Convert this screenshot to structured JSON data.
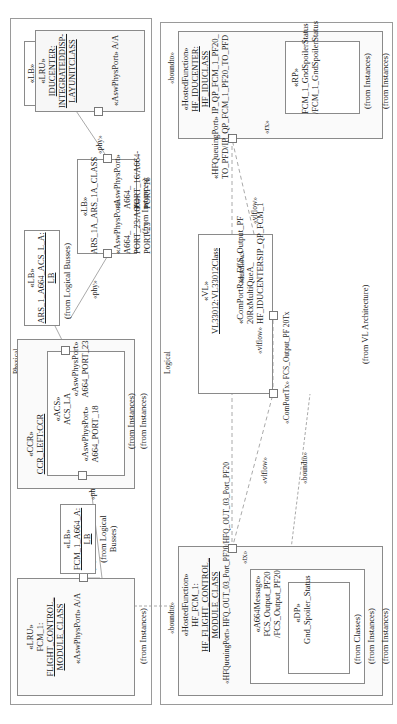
{
  "frames": {
    "physical": {
      "label": "Physical"
    },
    "logical": {
      "label": "Logical"
    }
  },
  "physical": {
    "lru_fcm": {
      "stereotype": "«LRU»",
      "name_line1": "FCM_1:",
      "name_line2": "FLIGHT_CONTROL_",
      "name_line3": "MODULE_CLASS",
      "port_label": "«AswPhysPort» A/A",
      "from": "(from Instances)"
    },
    "lb_fcm": {
      "stereotype": "«LB»",
      "name_line1": "FCM_1_A664_A:",
      "name_line2": "LB",
      "from_line1": "(from Logical",
      "from_line2": "Busses)"
    },
    "ccr": {
      "stereotype": "«CCR»",
      "name": "CCR_LEFT:CCR",
      "from": "(from Instances)",
      "acs": {
        "stereotype": "«ACS»",
        "name": "ACS_LA",
        "port_top_label_1": "«AswPhysPort»",
        "port_top_label_2": "A664_PORT_23",
        "port_bottom_label_1": "«AswPhysPort»",
        "port_bottom_label_2": "A664_PORT_18",
        "from": "(from Instances)"
      }
    },
    "lb_ars_acs": {
      "stereotype": "«LB»",
      "name_line1": "ARS_1_A664_ACS_L_A:",
      "name_line2": "LB",
      "from": "(from Logical Busses)"
    },
    "ars": {
      "stereotype": "«LB»",
      "name": "ARS_1A_ARS_1A_CLASS",
      "port_left_label_1": "«AswPhysPort» A664_",
      "port_left_label_2": "PORT_23/A664-PORT-23",
      "port_right_label_1": "«AswPhysPort» A664_",
      "port_right_label_2": "PORT_16/A664-PORT-16",
      "from": "(from Instances)"
    },
    "lb_idu": {
      "stereotype": "«LB»",
      "name_line1": "IDU_C_A664_1A_",
      "name_line2": "LB"
    },
    "lru_idu": {
      "stereotype": "«LRU»",
      "name_line1": "IDUCENTER:",
      "name_line2": "INTEGRATEDDISP-",
      "name_line3": "LAYUNITCLASS",
      "port_label": "«AswPhysPort» A/A"
    },
    "connector_labels": {
      "phy_1": "«phy»",
      "phy_2": "«phy»",
      "phy_3": "«phy»",
      "phy_4": "«phy»",
      "phy_5": "«phy»"
    }
  },
  "logical": {
    "hf_fcm": {
      "boundto": "«boundto»",
      "stereotype": "«HostedFunction»",
      "name_line1": "HF_FCM_1:",
      "name_line2": "HF_FLIGHT_CONTROL_",
      "name_line3": "MODULE_CLASS",
      "port_label": "«HFQueuingPort» HFQ_OUT_03_Port_PF20/HFQ_OUT_03_Port_PF20",
      "tx": "«tx»",
      "message": {
        "stereotype": "«A664Message»",
        "name_line1": "FCS_Output_PF20",
        "name_line2": "/FCS_Output_PF20",
        "dp": {
          "stereotype": "«DP»",
          "name": "Gnd_Spoiler_Status",
          "from": "(from Classes)"
        },
        "from": "(from Instances)"
      },
      "from": "(from Instances)"
    },
    "vl": {
      "stereotype": "«VL»",
      "name": "VL33012:VL33012Class",
      "rx_label_1": "«ComPortRx» FCS_Output_PF 20RxMultiQueA_",
      "rx_label_2": "HF_IDUCENTERSIP_QP_FCM_1",
      "tx_label": "«ComPortTx» FCS_Output_PF 20Tx",
      "from": "(from VL Architecture)"
    },
    "hf_idu": {
      "boundto": "«boundto»",
      "stereotype": "«HostedFunction»",
      "name_line1": "HF_IDUCENTER:",
      "name_line2": "HF_IDUCLASS",
      "port_label_1": "«HFQueuingPort» IP_QP_FCM_1_PF20_",
      "port_label_2": "TO_PFD/IP_QP_FCM_1_PF20_TO_PFD",
      "rx": "«rx»",
      "rp": {
        "stereotype": "«RP»",
        "name_line1": "FCM_1_GndSpoilerStatus",
        "name_line2": "/FCM_1_GndSpoilerStatus",
        "from": "(from Instances)"
      },
      "from": "(from Instances)"
    },
    "connector_labels": {
      "vlflow_1": "«vlflow»",
      "vlflow_2": "«vlflow»",
      "vlflow_3": "«vlflow»",
      "dataflow": "«dataflow»",
      "boundto": "«boundto»"
    }
  },
  "colors": {
    "frame_border": "#9a9a9a",
    "box_border": "#8a8a8a",
    "box_fill": "#fafafa",
    "line": "#aaaaaa",
    "text": "#222222"
  }
}
